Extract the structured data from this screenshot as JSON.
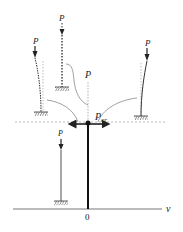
{
  "diagram": {
    "title": "",
    "labels": {
      "load_top_center": "P",
      "load_top_left": "P",
      "load_top_right": "P",
      "load_bottom_left": "P",
      "equilibrium_axis": "P",
      "critical_load": "P",
      "critical_load_subscript": "cr",
      "origin": "0",
      "horizontal_axis": "v"
    },
    "colors": {
      "line": "#222222",
      "curve": "#888888",
      "dashed": "#999999",
      "background": "#ffffff"
    },
    "elements": [
      {
        "name": "column-straight-stable",
        "description": "straight column below Pcr, fixed base, load P"
      },
      {
        "name": "column-straight-unstable",
        "description": "straight dashed column above Pcr, fixed base, load P"
      },
      {
        "name": "column-buckled-left",
        "description": "column bent left under load P"
      },
      {
        "name": "column-buckled-right",
        "description": "column bent right under load P"
      },
      {
        "name": "bifurcation-point",
        "description": "critical load point Pcr on P axis"
      }
    ]
  }
}
